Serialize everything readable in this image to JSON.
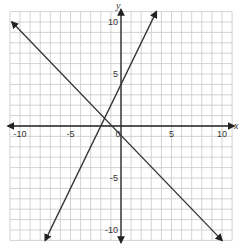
{
  "chart_data": {
    "type": "line",
    "title": "",
    "xlabel": "x",
    "ylabel": "y",
    "xlim": [
      -11,
      11
    ],
    "ylim": [
      -11,
      11
    ],
    "grid": true,
    "x_ticks": [
      -10,
      -5,
      0,
      5,
      10
    ],
    "y_ticks": [
      10,
      5,
      -5,
      -10
    ],
    "tick_labels": {
      "x": [
        "-10",
        "-5",
        "0",
        "5",
        "10"
      ],
      "y": [
        "10",
        "5",
        "-5",
        "-10"
      ]
    },
    "series": [
      {
        "name": "line-1",
        "equation": "y = 2x + 4",
        "points": [
          [
            -7.5,
            -11
          ],
          [
            3.5,
            11
          ]
        ],
        "arrows": true
      },
      {
        "name": "line-2",
        "equation": "y = -x",
        "points": [
          [
            -10.8,
            10
          ],
          [
            10,
            -11
          ]
        ],
        "arrows": true
      }
    ],
    "intersection": [
      -1.33,
      1.33
    ],
    "legend": "none"
  },
  "labels": {
    "x_axis": "x",
    "y_axis": "y",
    "origin": "0"
  },
  "colors": {
    "grid": "#c8c8c8",
    "axis": "#222222",
    "line": "#333333"
  }
}
